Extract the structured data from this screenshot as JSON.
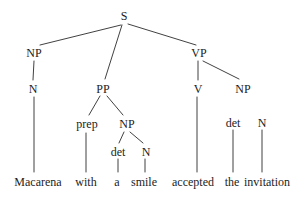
{
  "diagram": {
    "type": "syntax-parse-tree",
    "nodes": {
      "s": "S",
      "np_subject": "NP",
      "vp": "VP",
      "n_subject": "N",
      "pp": "PP",
      "v": "V",
      "np_object": "NP",
      "prep": "prep",
      "np_pp": "NP",
      "det_pp": "det",
      "n_pp": "N",
      "det_object": "det",
      "n_object": "N"
    },
    "words": {
      "w1": "Macarena",
      "w2": "with",
      "w3": "a",
      "w4": "smile",
      "w5": "accepted",
      "w6": "the",
      "w7": "invitation"
    },
    "colors": {
      "text": "#1c1c1c",
      "line": "#2b2b2b",
      "background": "#ffffff"
    }
  }
}
